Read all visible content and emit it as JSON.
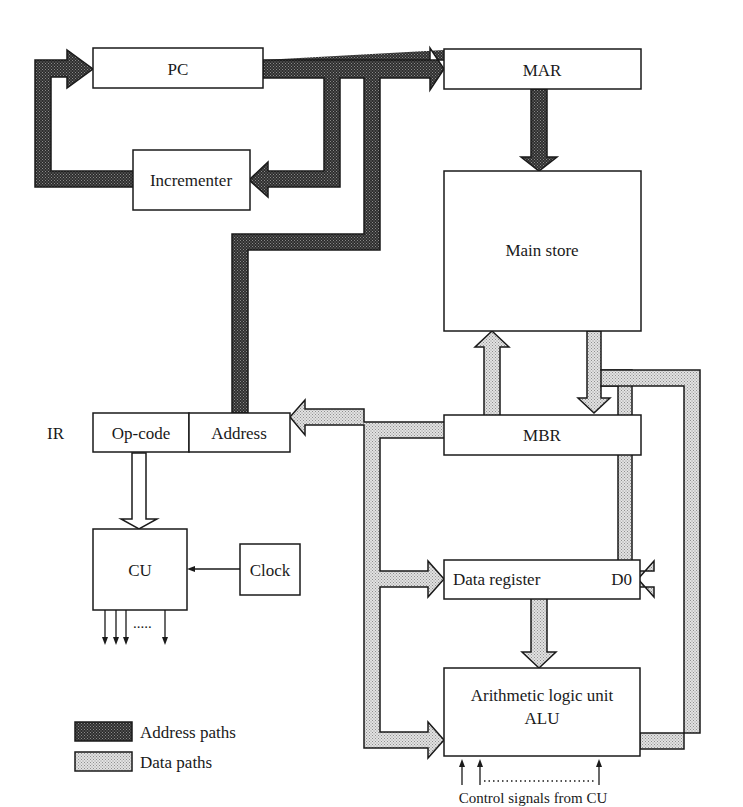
{
  "diagram": {
    "blocks": {
      "pc": "PC",
      "mar": "MAR",
      "incrementer": "Incrementer",
      "main_store": "Main store",
      "ir_label": "IR",
      "ir_opcode": "Op-code",
      "ir_address": "Address",
      "mbr": "MBR",
      "data_register": "Data register",
      "data_register_id": "D0",
      "cu": "CU",
      "clock": "Clock",
      "alu_line1": "Arithmetic logic unit",
      "alu_line2": "ALU"
    },
    "annotations": {
      "cu_outputs_dots": ".....",
      "control_signals": "Control signals from CU"
    },
    "legend": [
      {
        "key": "address",
        "label": "Address paths",
        "color": "#3a3a3a"
      },
      {
        "key": "data",
        "label": "Data paths",
        "color": "#c8c8c8"
      }
    ],
    "paths": {
      "address": [
        "PC -> MAR",
        "PC -> Incrementer",
        "Incrementer -> PC",
        "IR.Address -> MAR",
        "MAR -> Main store"
      ],
      "data": [
        "Main store -> MBR",
        "MBR -> Main store",
        "Data bus -> IR.Address",
        "Data bus -> Data register D0",
        "Data bus -> ALU",
        "Data register -> ALU",
        "ALU -> Data register D0"
      ]
    }
  }
}
